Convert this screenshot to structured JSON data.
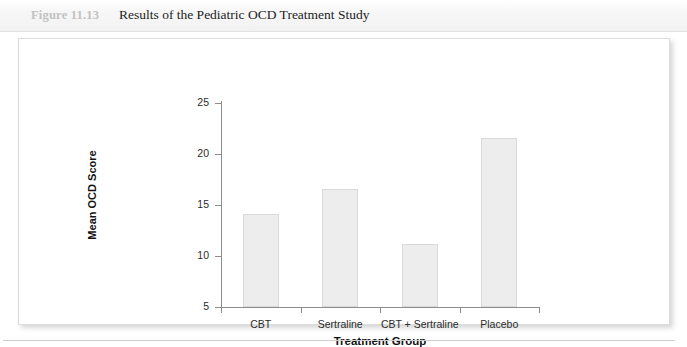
{
  "figure": {
    "number_label": "Figure 11.13",
    "caption": "Results of the Pediatric OCD Treatment Study"
  },
  "colors": {
    "bar_fill": "#ededed",
    "bar_border": "#dadada",
    "axis": "#8d8d8d",
    "figure_number_text": "#c2c2c2",
    "caption_text": "#1d1d1d"
  },
  "chart_data": {
    "type": "bar",
    "title": "Results of the Pediatric OCD Treatment Study",
    "categories": [
      "CBT",
      "Sertraline",
      "CBT + Sertraline",
      "Placebo"
    ],
    "values": [
      14.1,
      16.6,
      11.2,
      21.6
    ],
    "xlabel": "Treatment Group",
    "ylabel": "Mean OCD Score",
    "ylim": [
      5,
      25
    ],
    "yticks": [
      5,
      10,
      15,
      20,
      25
    ],
    "ytick_labels": [
      "5",
      "10",
      "15",
      "20",
      "25"
    ],
    "grid": false,
    "legend": false
  }
}
